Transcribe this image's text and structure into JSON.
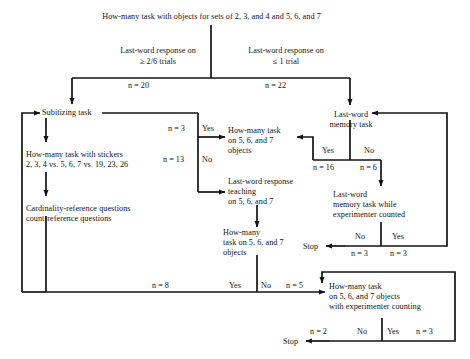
{
  "figure": {
    "type": "flowchart",
    "title": "How-many task with objects for sets of 2, 3, and 4 and 5, 6, and 7"
  },
  "nodes": {
    "root": "How-many task with objects for sets of 2, 3, and 4 and 5, 6, and 7",
    "cond_left_l1": "Last-word response on",
    "cond_left_l2": "≥ 2/6 trials",
    "cond_right_l1": "Last-word response on",
    "cond_right_l2": "≤ 1 trial",
    "subitizing": "Subitizing task",
    "stickers_l1": "How-many task with stickers",
    "stickers_l2": "2, 3, 4 vs. 5, 6, 7 vs. 19, 23, 26",
    "cardref_l1": "Cardinality-reference questions",
    "cardref_l2": "count-reference questions",
    "howmany567_top_l1": "How-many task",
    "howmany567_top_l2": "on 5, 6, and 7",
    "howmany567_top_l3": "objects",
    "lwteach_l1": "Last-word response",
    "lwteach_l2": "teaching",
    "lwteach_l3": "on 5, 6, and 7",
    "howmany567_mid_l1": "How-many",
    "howmany567_mid_l2": "task on 5, 6, and 7",
    "howmany567_mid_l3": "objects",
    "lwmemory_l1": "Last-word",
    "lwmemory_l2": "memory task",
    "lwmemcount_l1": "Last-word",
    "lwmemcount_l2": "memory task while",
    "lwmemcount_l3": "experimenter counted",
    "howmanycount_l1": "How-many task",
    "howmanycount_l2": "on 5, 6, and 7 objects",
    "howmanycount_l3": "with experimenter counting",
    "stop_right": "Stop",
    "stop_bottom": "Stop"
  },
  "edge_labels": {
    "n20": "n = 20",
    "n22": "n = 22",
    "n3_top": "n = 3",
    "n13": "n = 13",
    "n16": "n = 16",
    "n6": "n = 6",
    "n3_stopleft": "n = 3",
    "n3_yesright": "n = 3",
    "n8": "n = 8",
    "n5": "n = 5",
    "n2": "n = 2",
    "n3_bottomyes": "n = 3",
    "yes_subitizing": "Yes",
    "no_subitizing": "No",
    "yes_memory": "Yes",
    "no_memory": "No",
    "no_memcount": "No",
    "yes_memcount": "Yes",
    "yes_midtask": "Yes",
    "no_midtask": "No",
    "no_counttask": "No",
    "yes_counttask": "Yes"
  },
  "style": {
    "ink": "#131313",
    "paper": "#ffffff"
  }
}
